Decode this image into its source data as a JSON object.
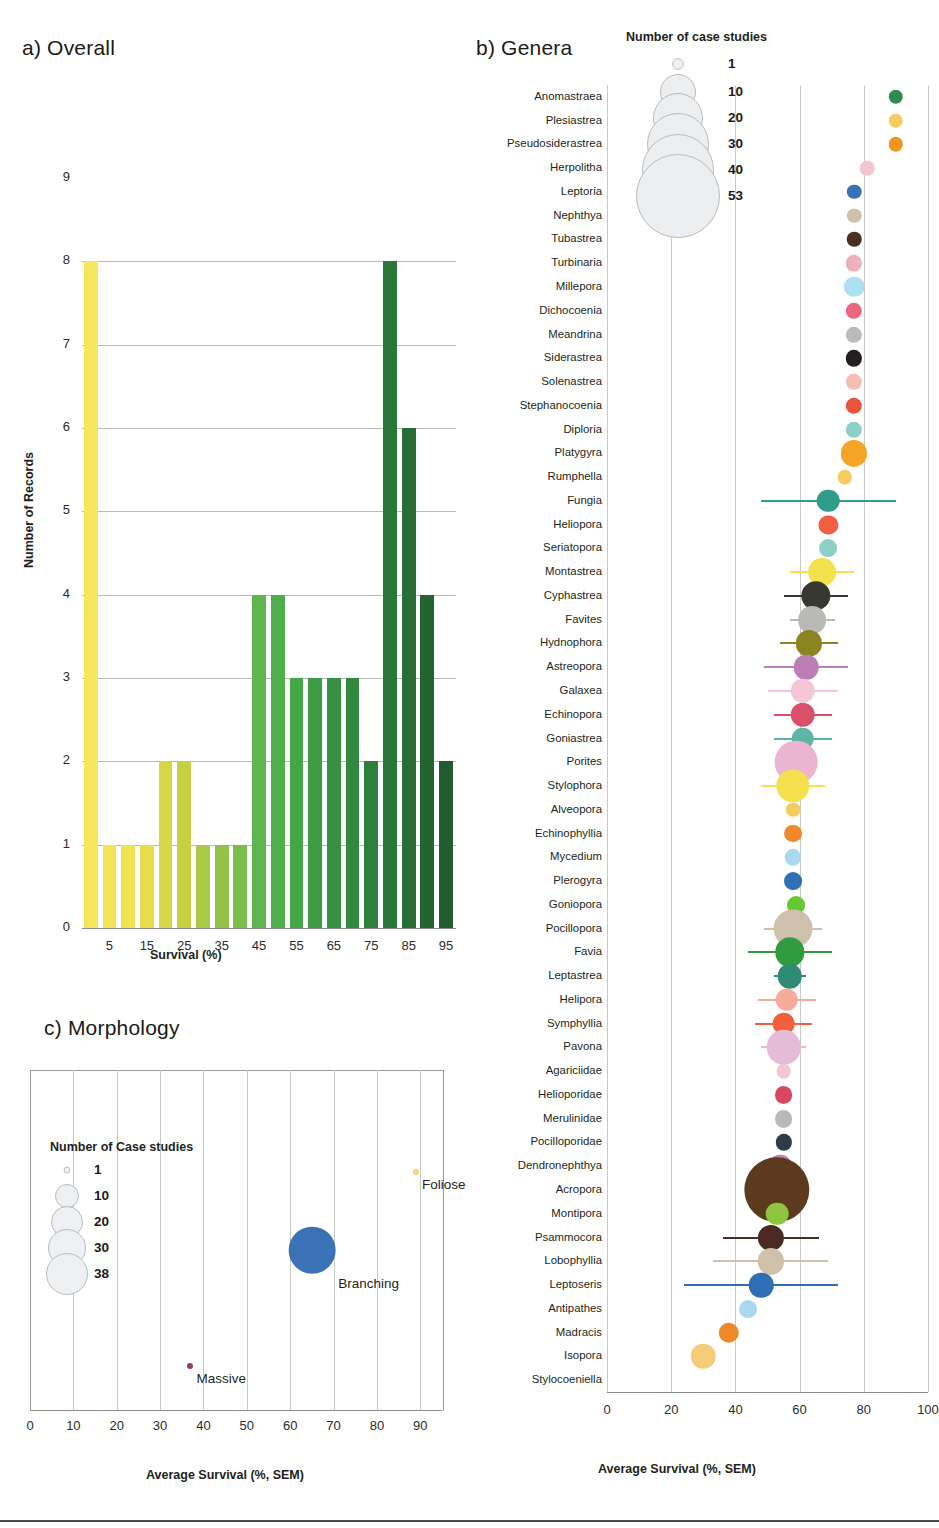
{
  "panels": {
    "a": {
      "title": "a) Overall",
      "ylabel": "Number of Records",
      "xlabel": "Survival (%)"
    },
    "b": {
      "title": "b) Genera",
      "xlabel": "Average Survival (%, SEM)"
    },
    "c": {
      "title": "c) Morphology",
      "xlabel": "Average Survival (%, SEM)"
    }
  },
  "legend_b": {
    "title": "Number of case studies",
    "entries": [
      "1",
      "10",
      "20",
      "30",
      "40",
      "53"
    ]
  },
  "legend_c": {
    "title": "Number of Case studies",
    "entries": [
      "1",
      "10",
      "20",
      "30",
      "38"
    ]
  },
  "chart_data": [
    {
      "type": "bar",
      "title": "a) Overall",
      "xlabel": "Survival (%)",
      "ylabel": "Number of Records",
      "ylim": [
        0,
        9
      ],
      "yticks": [
        "0",
        "1",
        "2",
        "3",
        "4",
        "5",
        "6",
        "7",
        "8",
        "9"
      ],
      "xticks": [
        "5",
        "15",
        "25",
        "35",
        "45",
        "55",
        "65",
        "75",
        "85",
        "95"
      ],
      "categories": [
        "0",
        "5",
        "10",
        "15",
        "20",
        "25",
        "30",
        "35",
        "40",
        "45",
        "50",
        "55",
        "60",
        "65",
        "70",
        "75",
        "80",
        "85",
        "90",
        "95",
        "100"
      ],
      "values": [
        8,
        1,
        1,
        1,
        2,
        2,
        1,
        1,
        1,
        4,
        4,
        3,
        3,
        3,
        3,
        2,
        8,
        6,
        4,
        2
      ],
      "grid": true,
      "colors": [
        "#f5e65c",
        "#f3e455",
        "#f0e24f",
        "#e6dd4b",
        "#d6d745",
        "#c6d041",
        "#abc847",
        "#93c24b",
        "#7bbc4f",
        "#5fb54e",
        "#4fae4b",
        "#45a648",
        "#3d9c45",
        "#379142",
        "#33883f",
        "#2f7f3c",
        "#2b7639",
        "#286d36",
        "#246433",
        "#205c30"
      ]
    },
    {
      "type": "scatter",
      "title": "b) Genera",
      "xlabel": "Average Survival (%, SEM)",
      "xlim": [
        0,
        100
      ],
      "xticks": [
        "0",
        "20",
        "40",
        "60",
        "80",
        "100"
      ],
      "ylabel": "",
      "size_legend": "Number of case studies",
      "points": [
        {
          "genus": "Anomastraea",
          "survival": 90,
          "n": 1,
          "sem": 0,
          "color": "#2f8b4e"
        },
        {
          "genus": "Plesiastrea",
          "survival": 90,
          "n": 1,
          "sem": 0,
          "color": "#f5cc5e"
        },
        {
          "genus": "Pseudosiderastrea",
          "survival": 90,
          "n": 1,
          "sem": 0,
          "color": "#f0961e"
        },
        {
          "genus": "Herpolitha",
          "survival": 81,
          "n": 1,
          "sem": 0,
          "color": "#f5c6d2"
        },
        {
          "genus": "Leptoria",
          "survival": 77,
          "n": 1,
          "sem": 0,
          "color": "#3872b4"
        },
        {
          "genus": "Nephthya",
          "survival": 77,
          "n": 1,
          "sem": 0,
          "color": "#cfc0ab"
        },
        {
          "genus": "Tubastrea",
          "survival": 77,
          "n": 1,
          "sem": 0,
          "color": "#4a3223"
        },
        {
          "genus": "Turbinaria",
          "survival": 77,
          "n": 1.5,
          "sem": 0,
          "color": "#eeb2bd"
        },
        {
          "genus": "Millepora",
          "survival": 77,
          "n": 3,
          "sem": 0,
          "color": "#ade0f2"
        },
        {
          "genus": "Dichocoenia",
          "survival": 77,
          "n": 1.5,
          "sem": 0,
          "color": "#e8697f"
        },
        {
          "genus": "Meandrina",
          "survival": 77,
          "n": 1.5,
          "sem": 0,
          "color": "#b9bbbd"
        },
        {
          "genus": "Siderastrea",
          "survival": 77,
          "n": 1.5,
          "sem": 0,
          "color": "#231f20"
        },
        {
          "genus": "Solenastrea",
          "survival": 77,
          "n": 1.5,
          "sem": 0,
          "color": "#f7bdb2"
        },
        {
          "genus": "Stephanocoenia",
          "survival": 77,
          "n": 1.5,
          "sem": 0,
          "color": "#e8563a"
        },
        {
          "genus": "Diploria",
          "survival": 77,
          "n": 1.5,
          "sem": 0,
          "color": "#8ecfc8"
        },
        {
          "genus": "Platygyra",
          "survival": 77,
          "n": 6,
          "sem": 4,
          "color": "#f5a525"
        },
        {
          "genus": "Rumphella",
          "survival": 74,
          "n": 1,
          "sem": 0,
          "color": "#f5cc5e"
        },
        {
          "genus": "Fungia",
          "survival": 69,
          "n": 4,
          "sem": 21,
          "color": "#2f9d8a"
        },
        {
          "genus": "Heliopora",
          "survival": 69,
          "n": 2.5,
          "sem": 0,
          "color": "#f06040"
        },
        {
          "genus": "Seriatopora",
          "survival": 69,
          "n": 2,
          "sem": 0,
          "color": "#8ecfc8"
        },
        {
          "genus": "Montastrea",
          "survival": 67,
          "n": 7,
          "sem": 10,
          "color": "#f5e04e"
        },
        {
          "genus": "Cyphastrea",
          "survival": 65,
          "n": 8,
          "sem": 10,
          "color": "#383830"
        },
        {
          "genus": "Favites",
          "survival": 64,
          "n": 7,
          "sem": 7,
          "color": "#b9b9b6"
        },
        {
          "genus": "Hydnophora",
          "survival": 63,
          "n": 6,
          "sem": 9,
          "color": "#8b8420"
        },
        {
          "genus": "Astreopora",
          "survival": 62,
          "n": 5,
          "sem": 13,
          "color": "#bb7fb5"
        },
        {
          "genus": "Galaxea",
          "survival": 61,
          "n": 5,
          "sem": 11,
          "color": "#f5c6d8"
        },
        {
          "genus": "Echinopora",
          "survival": 61,
          "n": 5,
          "sem": 9,
          "color": "#d8506a"
        },
        {
          "genus": "Goniastrea",
          "survival": 61,
          "n": 4,
          "sem": 9,
          "color": "#5fb5a5"
        },
        {
          "genus": "Porites",
          "survival": 59,
          "n": 20,
          "sem": 6,
          "color": "#eab4d2"
        },
        {
          "genus": "Stylophora",
          "survival": 58,
          "n": 11,
          "sem": 10,
          "color": "#f5e04e"
        },
        {
          "genus": "Alveopora",
          "survival": 58,
          "n": 1,
          "sem": 0,
          "color": "#f5cc5e"
        },
        {
          "genus": "Echinophyllia",
          "survival": 58,
          "n": 2,
          "sem": 0,
          "color": "#f0892a"
        },
        {
          "genus": "Mycedium",
          "survival": 58,
          "n": 1.5,
          "sem": 0,
          "color": "#a9d8ef"
        },
        {
          "genus": "Plerogyra",
          "survival": 58,
          "n": 2,
          "sem": 0,
          "color": "#2f6fb5"
        },
        {
          "genus": "Goniopora",
          "survival": 59,
          "n": 2,
          "sem": 0,
          "color": "#64c832"
        },
        {
          "genus": "Pocillopora",
          "survival": 58,
          "n": 16,
          "sem": 9,
          "color": "#cfc0ab"
        },
        {
          "genus": "Favia",
          "survival": 57,
          "n": 8,
          "sem": 13,
          "color": "#2f9d3f"
        },
        {
          "genus": "Leptastrea",
          "survival": 57,
          "n": 5,
          "sem": 5,
          "color": "#2f8b74"
        },
        {
          "genus": "Helipora",
          "survival": 56,
          "n": 4,
          "sem": 9,
          "color": "#f7ab9a"
        },
        {
          "genus": "Symphyllia",
          "survival": 55,
          "n": 4,
          "sem": 9,
          "color": "#f0603a"
        },
        {
          "genus": "Pavona",
          "survival": 55,
          "n": 12,
          "sem": 7,
          "color": "#e5bcd8"
        },
        {
          "genus": "Agariciidae",
          "survival": 55,
          "n": 1,
          "sem": 0,
          "color": "#f2c6d2"
        },
        {
          "genus": "Helioporidae",
          "survival": 55,
          "n": 2,
          "sem": 0,
          "color": "#d8485e"
        },
        {
          "genus": "Merulinidae",
          "survival": 55,
          "n": 2,
          "sem": 0,
          "color": "#b9b9b6"
        },
        {
          "genus": "Pocilloporidae",
          "survival": 55,
          "n": 1.5,
          "sem": 0,
          "color": "#2b3d4a"
        },
        {
          "genus": "Dendronephthya",
          "survival": 54,
          "n": 4,
          "sem": 0,
          "color": "#bb7fb5"
        },
        {
          "genus": "Acropora",
          "survival": 53,
          "n": 53,
          "sem": 7,
          "color": "#5c3a1e"
        },
        {
          "genus": "Montipora",
          "survival": 53,
          "n": 4,
          "sem": 0,
          "color": "#8cc63f"
        },
        {
          "genus": "Psammocora",
          "survival": 51,
          "n": 6,
          "sem": 15,
          "color": "#4a2a22"
        },
        {
          "genus": "Lobophyllia",
          "survival": 51,
          "n": 6,
          "sem": 18,
          "color": "#cfc0ab"
        },
        {
          "genus": "Leptoseris",
          "survival": 48,
          "n": 5,
          "sem": 24,
          "color": "#2f6fb5"
        },
        {
          "genus": "Antipathes",
          "survival": 44,
          "n": 2,
          "sem": 0,
          "color": "#a9d8ef"
        },
        {
          "genus": "Madracis",
          "survival": 38,
          "n": 3,
          "sem": 0,
          "color": "#f0892a"
        },
        {
          "genus": "Isopora",
          "survival": 30,
          "n": 5,
          "sem": 0,
          "color": "#f5cc7a"
        },
        {
          "genus": "Stylocoeniella",
          "survival": null,
          "n": 0,
          "sem": 0,
          "color": "#ffffff"
        }
      ]
    },
    {
      "type": "scatter",
      "title": "c) Morphology",
      "xlabel": "Average Survival (%, SEM)",
      "xlim": [
        0,
        95
      ],
      "xticks": [
        "0",
        "10",
        "20",
        "30",
        "40",
        "50",
        "60",
        "70",
        "80",
        "90"
      ],
      "size_legend": "Number of Case studies",
      "points": [
        {
          "morphology": "Foliose",
          "survival": 89,
          "n": 1,
          "sem": 0,
          "color": "#f5d76e"
        },
        {
          "morphology": "Branching",
          "survival": 65,
          "n": 38,
          "sem": 5,
          "color": "#3a72b8"
        },
        {
          "morphology": "Massive",
          "survival": 37,
          "n": 1,
          "sem": 0,
          "color": "#a03a6e"
        }
      ]
    }
  ]
}
